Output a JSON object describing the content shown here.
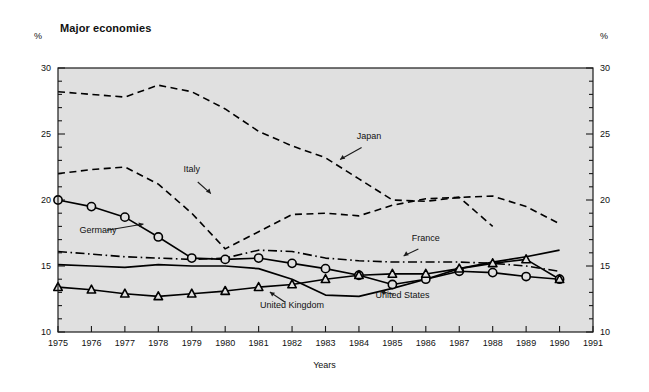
{
  "chart_data": {
    "type": "line",
    "title": "Major economies",
    "xlabel": "Years",
    "ylabel": "%",
    "unit_left": "%",
    "unit_right": "%",
    "xlim": [
      1975,
      1991
    ],
    "ylim": [
      10,
      30
    ],
    "x_ticks": [
      1975,
      1976,
      1977,
      1978,
      1979,
      1980,
      1981,
      1982,
      1983,
      1984,
      1985,
      1986,
      1987,
      1988,
      1989,
      1990,
      1991
    ],
    "x_tick_labels": [
      "1975",
      "1976",
      "1977",
      "1978",
      "1979",
      "1980",
      "1981",
      "1982",
      "1983",
      "1984",
      "1985",
      "1986",
      "1987",
      "1988",
      "1989",
      "1990",
      "1991"
    ],
    "y_ticks": [
      10,
      15,
      20,
      25,
      30
    ],
    "y_tick_labels": [
      "10",
      "15",
      "20",
      "25",
      "30"
    ],
    "y_minor_step": 1,
    "grid": false,
    "plot_background": "#e0e0e0",
    "line_color": "#000000",
    "legend": "inline-annotations",
    "series": [
      {
        "name": "Japan",
        "style": "dashed",
        "marker": "none",
        "label_x": 1984.3,
        "label_y": 24.6,
        "arrow_to_x": 1983.4,
        "arrow_to_y": 23.0,
        "x": [
          1975,
          1976,
          1977,
          1978,
          1979,
          1980,
          1981,
          1982,
          1983,
          1984,
          1985,
          1986,
          1987,
          1988,
          1989,
          1990
        ],
        "values": [
          28.2,
          28.0,
          27.8,
          28.7,
          28.2,
          26.9,
          25.2,
          24.1,
          23.2,
          21.6,
          20.0,
          19.9,
          20.2,
          20.3,
          19.5,
          18.2
        ]
      },
      {
        "name": "Italy",
        "style": "dashed",
        "marker": "none",
        "label_x": 1979.0,
        "label_y": 22.1,
        "arrow_to_x": 1979.6,
        "arrow_to_y": 20.4,
        "x": [
          1975,
          1976,
          1977,
          1978,
          1979,
          1980,
          1981,
          1982,
          1983,
          1984,
          1985,
          1986,
          1987,
          1988
        ],
        "values": [
          22.0,
          22.3,
          22.5,
          21.2,
          19.0,
          16.3,
          17.6,
          18.9,
          19.0,
          18.8,
          19.6,
          20.1,
          20.2,
          18.0
        ]
      },
      {
        "name": "Germany",
        "style": "solid",
        "marker": "circle",
        "label_x": 1976.2,
        "label_y": 17.5,
        "arrow_to_x": 1977.6,
        "arrow_to_y": 18.2,
        "x": [
          1975,
          1976,
          1977,
          1978,
          1979,
          1980,
          1981,
          1982,
          1983,
          1984,
          1985,
          1986,
          1987,
          1988,
          1989,
          1990
        ],
        "values": [
          20.0,
          19.5,
          18.7,
          17.2,
          15.6,
          15.5,
          15.6,
          15.2,
          14.8,
          14.3,
          13.6,
          14.0,
          14.6,
          14.5,
          14.2,
          14.0
        ]
      },
      {
        "name": "France",
        "style": "dashdot",
        "marker": "none",
        "label_x": 1986.0,
        "label_y": 16.9,
        "arrow_to_x": 1985.3,
        "arrow_to_y": 15.7,
        "x": [
          1975,
          1976,
          1977,
          1978,
          1979,
          1980,
          1981,
          1982,
          1983,
          1984,
          1985,
          1986,
          1987,
          1988,
          1989,
          1990
        ],
        "values": [
          16.1,
          15.9,
          15.7,
          15.6,
          15.5,
          15.6,
          16.2,
          16.1,
          15.6,
          15.4,
          15.3,
          15.3,
          15.3,
          15.2,
          15.0,
          14.6
        ]
      },
      {
        "name": "United States",
        "style": "solid",
        "marker": "none",
        "label_x": 1985.3,
        "label_y": 12.6,
        "arrow_to_x": 1984.6,
        "arrow_to_y": 13.1,
        "x": [
          1975,
          1976,
          1977,
          1978,
          1979,
          1980,
          1981,
          1982,
          1983,
          1984,
          1985,
          1986,
          1987,
          1988,
          1989,
          1990
        ],
        "values": [
          15.1,
          15.0,
          14.9,
          15.1,
          15.0,
          15.0,
          14.8,
          14.0,
          12.8,
          12.7,
          13.3,
          14.0,
          14.8,
          15.3,
          15.7,
          16.2
        ]
      },
      {
        "name": "United Kingdom",
        "style": "solid",
        "marker": "triangle",
        "label_x": 1982.0,
        "label_y": 11.8,
        "arrow_to_x": 1981.3,
        "arrow_to_y": 13.1,
        "x": [
          1975,
          1976,
          1977,
          1978,
          1979,
          1980,
          1981,
          1982,
          1983,
          1984,
          1985,
          1986,
          1987,
          1988,
          1989,
          1990
        ],
        "values": [
          13.4,
          13.2,
          12.9,
          12.7,
          12.9,
          13.1,
          13.4,
          13.6,
          14.0,
          14.3,
          14.4,
          14.4,
          14.8,
          15.2,
          15.5,
          14.0
        ]
      }
    ]
  }
}
